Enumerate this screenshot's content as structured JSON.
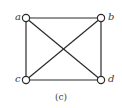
{
  "figure": {
    "caption": "(c)",
    "graph": "K4",
    "vertices": [
      {
        "id": "a",
        "label": "a",
        "x": 26,
        "y": 18
      },
      {
        "id": "b",
        "label": "b",
        "x": 101,
        "y": 18
      },
      {
        "id": "c",
        "label": "c",
        "x": 26,
        "y": 80
      },
      {
        "id": "d",
        "label": "d",
        "x": 101,
        "y": 80
      }
    ],
    "edges": [
      [
        "a",
        "b"
      ],
      [
        "a",
        "c"
      ],
      [
        "a",
        "d"
      ],
      [
        "b",
        "c"
      ],
      [
        "b",
        "d"
      ],
      [
        "c",
        "d"
      ]
    ],
    "colors": {
      "stroke": "#2a2a2a",
      "node_fill": "#ffffff",
      "label": "#3a3a3a"
    }
  }
}
